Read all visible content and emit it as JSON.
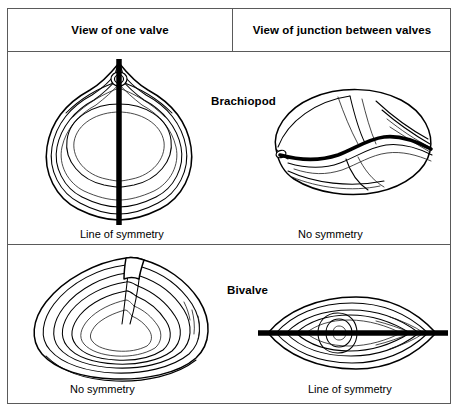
{
  "figure": {
    "columns": [
      {
        "id": "one-valve",
        "label": "View of one valve"
      },
      {
        "id": "junction",
        "label": "View of junction between valves"
      }
    ],
    "rows": [
      {
        "id": "brachiopod",
        "taxon_label": "Brachiopod",
        "cells": [
          {
            "id": "brachiopod-one-valve",
            "caption": "Line of symmetry",
            "symmetry": "bilateral",
            "illustration": "brachiopod-valve-with-beak-and-foramen"
          },
          {
            "id": "brachiopod-junction",
            "caption": "No symmetry",
            "symmetry": "none",
            "illustration": "brachiopod-junction-zigzag-commissure"
          }
        ]
      },
      {
        "id": "bivalve",
        "taxon_label": "Bivalve",
        "cells": [
          {
            "id": "bivalve-one-valve",
            "caption": "No symmetry",
            "symmetry": "none",
            "illustration": "bivalve-valve-offset-umbo-growth-rings"
          },
          {
            "id": "bivalve-junction",
            "caption": "Line of symmetry",
            "symmetry": "bilateral",
            "illustration": "bivalve-junction-straight-commissure"
          }
        ]
      }
    ],
    "colors": {
      "ink": "#000000",
      "rule": "#5a5a5a",
      "background": "#ffffff"
    }
  }
}
